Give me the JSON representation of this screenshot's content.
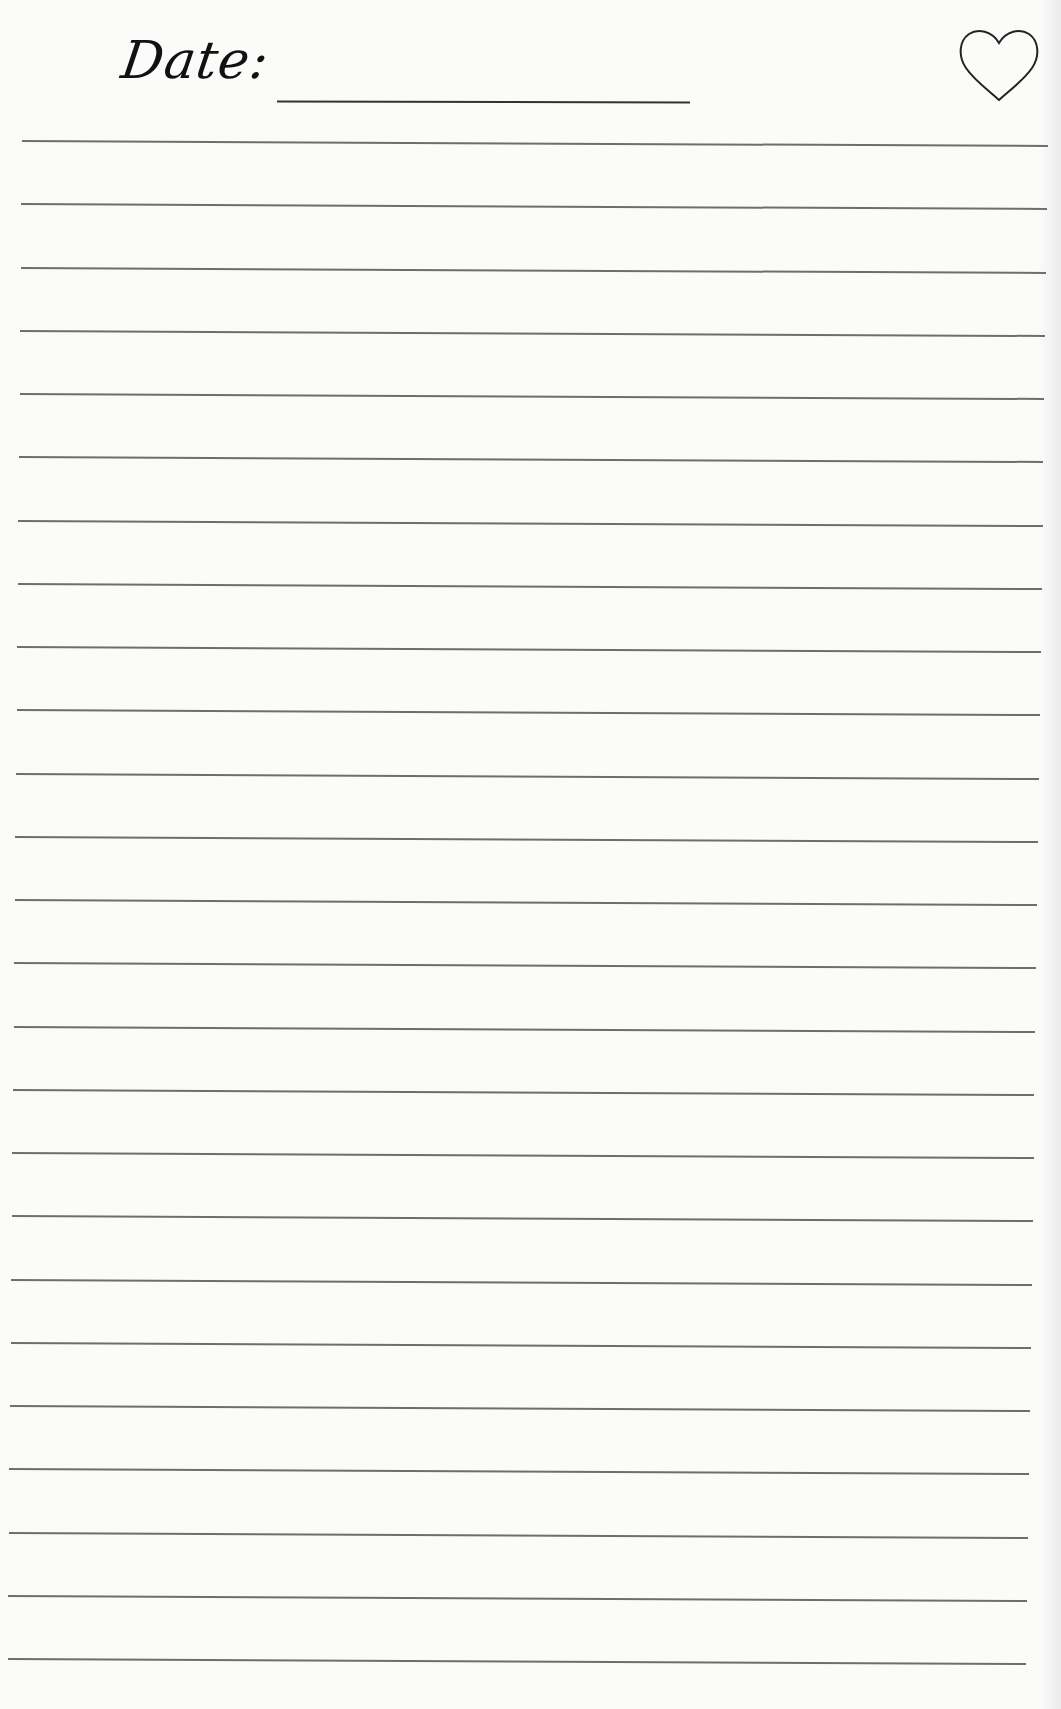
{
  "header": {
    "date_label": "Date:",
    "date_value": "",
    "heart_icon": "heart-outline-icon"
  },
  "page": {
    "type": "ruled-notebook-page",
    "ruled_line_count": 25,
    "line_color": "#6e6e6e",
    "background": "#fbfbfa"
  },
  "lines": [
    {
      "y": 140
    },
    {
      "y": 206
    },
    {
      "y": 272
    },
    {
      "y": 338
    },
    {
      "y": 404
    },
    {
      "y": 470
    },
    {
      "y": 536
    },
    {
      "y": 602
    },
    {
      "y": 668
    },
    {
      "y": 734
    },
    {
      "y": 800
    },
    {
      "y": 866
    },
    {
      "y": 932
    },
    {
      "y": 998
    },
    {
      "y": 1064
    },
    {
      "y": 1130
    },
    {
      "y": 1196
    },
    {
      "y": 1262
    },
    {
      "y": 1328
    },
    {
      "y": 1394
    },
    {
      "y": 1460
    },
    {
      "y": 1526
    },
    {
      "y": 1592
    },
    {
      "y": 1658
    }
  ]
}
